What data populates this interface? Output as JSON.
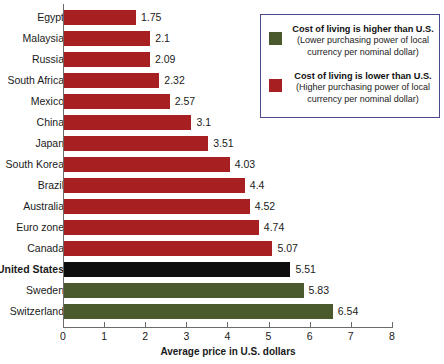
{
  "chart_data": {
    "type": "bar",
    "orientation": "horizontal",
    "title": "",
    "xlabel": "Average price in U.S. dollars",
    "ylabel": "",
    "xlim": [
      0,
      8
    ],
    "xticks": [
      0,
      1,
      2,
      3,
      4,
      5,
      6,
      7,
      8
    ],
    "grid": false,
    "legend_position": "top-right",
    "categories": [
      "Egypt",
      "Malaysia",
      "Russia",
      "South Africa",
      "Mexico",
      "China",
      "Japan",
      "South Korea",
      "Brazil",
      "Australia",
      "Euro zone",
      "Canada",
      "United States",
      "Sweden",
      "Switzerland"
    ],
    "values": [
      1.75,
      2.1,
      2.09,
      2.32,
      2.57,
      3.1,
      3.51,
      4.03,
      4.4,
      4.52,
      4.74,
      5.07,
      5.51,
      5.83,
      6.54
    ],
    "value_labels": [
      "1.75",
      "2.1",
      "2.09",
      "2.32",
      "2.57",
      "3.1",
      "3.51",
      "4.03",
      "4.4",
      "4.52",
      "4.74",
      "5.07",
      "5.51",
      "5.83",
      "6.54"
    ],
    "bar_colors": [
      "red",
      "red",
      "red",
      "red",
      "red",
      "red",
      "red",
      "red",
      "red",
      "red",
      "red",
      "red",
      "black",
      "green",
      "green"
    ],
    "highlight_category": "United States"
  },
  "colors": {
    "red": "#a81f22",
    "green": "#4b5a2c",
    "black": "#0d0d0d",
    "axis": "#6b6b6b",
    "legend_border": "#4a4a8a",
    "text": "#1a1a1a"
  },
  "legend": {
    "entries": [
      {
        "swatch": "green",
        "title": "Cost of living is higher than U.S.",
        "sub_line1": "(Lower purchasing power of local",
        "sub_line2": "currency per nominal dollar)"
      },
      {
        "swatch": "red",
        "title": "Cost of living is lower than U.S.",
        "sub_line1": "(Higher purchasing power of local",
        "sub_line2": "currency per nominal dollar)"
      }
    ]
  }
}
